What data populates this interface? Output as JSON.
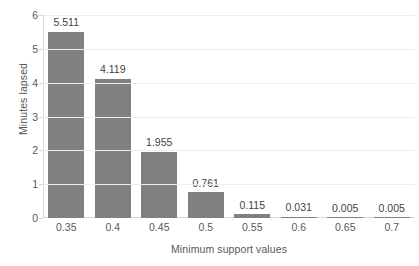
{
  "chart_data": {
    "type": "bar",
    "title": "",
    "xlabel": "Minimum support values",
    "ylabel": "Minutes lapsed",
    "categories": [
      "0.35",
      "0.4",
      "0.45",
      "0.5",
      "0.55",
      "0.6",
      "0.65",
      "0.7"
    ],
    "values": [
      5.511,
      4.119,
      1.955,
      0.761,
      0.115,
      0.031,
      0.005,
      0.005
    ],
    "data_labels": [
      "5.511",
      "4.119",
      "1.955",
      "0.761",
      "0.115",
      "0.031",
      "0.005",
      "0.005"
    ],
    "ylim": [
      0,
      6
    ],
    "ytick_labels": [
      "0",
      "1",
      "2",
      "3",
      "4",
      "5",
      "6"
    ],
    "ytick_values": [
      0,
      1,
      2,
      3,
      4,
      5,
      6
    ],
    "grid": true,
    "grid_axis": "y",
    "legend": false,
    "legend_position": "none",
    "series": [
      {
        "name": "Minutes lapsed",
        "values": [
          5.511,
          4.119,
          1.955,
          0.761,
          0.115,
          0.031,
          0.005,
          0.005
        ]
      }
    ],
    "colors": {
      "bar": "#808080",
      "gridline": "#ededed",
      "axis_line": "#d9d9d9",
      "tick_text": "#595959",
      "data_label_text": "#3f3f3f",
      "background": "#ffffff"
    }
  }
}
